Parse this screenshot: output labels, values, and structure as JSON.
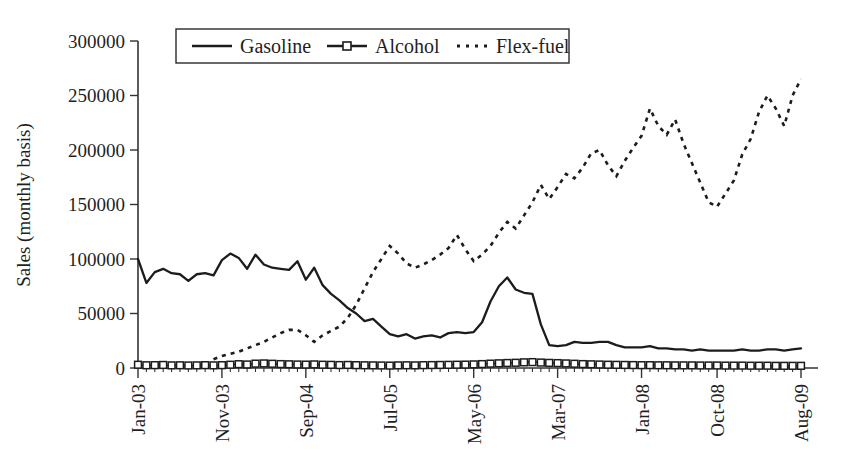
{
  "chart_data": {
    "type": "line",
    "title": "",
    "xlabel": "",
    "ylabel": "Sales (monthly basis)",
    "ylim": [
      0,
      300000
    ],
    "grid": false,
    "legend_position": "top-center",
    "y_ticks": [
      "0",
      "50000",
      "100000",
      "150000",
      "200000",
      "250000",
      "300000"
    ],
    "y_tick_values": [
      0,
      50000,
      100000,
      150000,
      200000,
      250000,
      300000
    ],
    "x_tick_labels": [
      "Jan-03",
      "Nov-03",
      "Sep-04",
      "Jul-05",
      "May-06",
      "Mar-07",
      "Jan-08",
      "Oct-08",
      "Aug-09"
    ],
    "x_tick_indices": [
      0,
      10,
      20,
      30,
      40,
      50,
      60,
      69,
      79
    ],
    "x_start": "Jan-03",
    "x_end": "Aug-09",
    "n_points": 80,
    "series": [
      {
        "name": "Gasoline",
        "style": "solid",
        "marker": "none",
        "color": "#1c1c1c",
        "values": [
          100000,
          78000,
          88000,
          91000,
          87000,
          86000,
          80000,
          86000,
          87000,
          85000,
          99000,
          105000,
          101000,
          91000,
          104000,
          95000,
          92000,
          91000,
          90000,
          98000,
          81000,
          92000,
          76000,
          68000,
          62000,
          55000,
          50000,
          43000,
          45000,
          38000,
          31000,
          29000,
          31000,
          27000,
          29000,
          30000,
          28000,
          32000,
          33000,
          32000,
          33000,
          42000,
          61000,
          75000,
          83000,
          72000,
          69000,
          68000,
          40000,
          21000,
          20000,
          21000,
          24000,
          23000,
          23000,
          24000,
          24000,
          21000,
          19000,
          19000,
          19000,
          20000,
          18000,
          18000,
          17000,
          17000,
          16000,
          17000,
          16000,
          16000,
          16000,
          16000,
          17000,
          16000,
          16000,
          17000,
          17000,
          16000,
          17000,
          18000
        ]
      },
      {
        "name": "Alcohol",
        "style": "solid",
        "marker": "square",
        "color": "#1c1c1c",
        "values": [
          3000,
          2500,
          2600,
          2800,
          2400,
          2500,
          2300,
          2400,
          2600,
          2400,
          2600,
          3000,
          3500,
          3200,
          4000,
          4200,
          3900,
          3600,
          3400,
          3200,
          3100,
          3300,
          3000,
          2900,
          2700,
          2800,
          2600,
          2500,
          2400,
          2300,
          2200,
          2400,
          2500,
          2400,
          2600,
          2700,
          2800,
          2900,
          3000,
          3100,
          3300,
          3600,
          4000,
          4300,
          4600,
          4800,
          5200,
          5400,
          5000,
          4700,
          4500,
          4200,
          3900,
          3600,
          3400,
          3200,
          3000,
          2900,
          2800,
          2700,
          2600,
          2600,
          2500,
          2500,
          2400,
          2400,
          2400,
          2300,
          2300,
          2300,
          2200,
          2200,
          2200,
          2100,
          2100,
          2100,
          2000,
          2000,
          2000,
          2000
        ]
      },
      {
        "name": "Flex-fuel",
        "style": "dotted",
        "marker": "none",
        "color": "#1c1c1c",
        "values": [
          0,
          0,
          0,
          0,
          0,
          0,
          0,
          0,
          0,
          8000,
          11000,
          13000,
          15000,
          18000,
          21000,
          24000,
          28000,
          32000,
          35000,
          35000,
          30000,
          24000,
          30000,
          34000,
          38000,
          46000,
          58000,
          73000,
          88000,
          100000,
          112000,
          105000,
          96000,
          92000,
          95000,
          99000,
          104000,
          110000,
          122000,
          109000,
          98000,
          104000,
          112000,
          124000,
          134000,
          128000,
          140000,
          152000,
          168000,
          155000,
          166000,
          178000,
          174000,
          184000,
          197000,
          200000,
          186000,
          176000,
          190000,
          202000,
          213000,
          238000,
          222000,
          214000,
          228000,
          206000,
          188000,
          170000,
          152000,
          148000,
          160000,
          172000,
          196000,
          210000,
          235000,
          250000,
          238000,
          222000,
          250000,
          265000
        ]
      }
    ]
  },
  "legend": {
    "items": [
      {
        "label": "Gasoline",
        "style": "solid"
      },
      {
        "label": "Alcohol",
        "style": "solid-square"
      },
      {
        "label": "Flex-fuel",
        "style": "dotted"
      }
    ]
  }
}
